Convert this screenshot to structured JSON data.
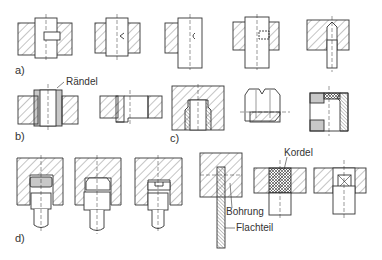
{
  "figure": {
    "sections": [
      {
        "id": "a",
        "label": "a)"
      },
      {
        "id": "b",
        "label": "b)"
      },
      {
        "id": "c",
        "label": "c)"
      },
      {
        "id": "d",
        "label": "d)"
      }
    ],
    "annotations": {
      "raendel": "Rändel",
      "kordel": "Kordel",
      "bohrung": "Bohrung",
      "flachteil": "Flachteil"
    },
    "colors": {
      "line": "#333333",
      "hatch": "#555555",
      "background": "#ffffff"
    }
  }
}
